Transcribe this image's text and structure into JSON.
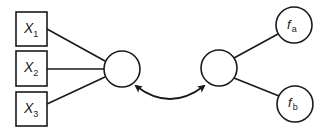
{
  "diagram": {
    "inputs": [
      {
        "label": "X",
        "subscript": "1"
      },
      {
        "label": "X",
        "subscript": "2"
      },
      {
        "label": "X",
        "subscript": "3"
      }
    ],
    "outputs": [
      {
        "label": "f",
        "subscript": "a"
      },
      {
        "label": "f",
        "subscript": "b"
      }
    ],
    "nodes": [
      "left-hidden-node",
      "right-hidden-node"
    ],
    "connection": "bidirectional-arrow",
    "colors": {
      "stroke": "#1a1a1a",
      "background": "#ffffff"
    }
  }
}
